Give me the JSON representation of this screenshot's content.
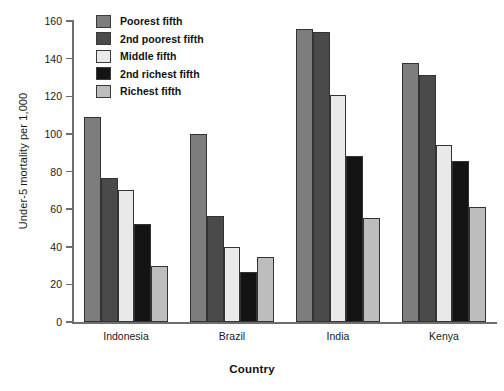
{
  "chart_data": {
    "type": "bar",
    "title": "",
    "xlabel": "Country",
    "ylabel": "Under-5 mortality per 1,000",
    "categories": [
      "Indonesia",
      "Brazil",
      "India",
      "Kenya"
    ],
    "ylim": [
      0,
      160
    ],
    "yticks": [
      0,
      20,
      40,
      60,
      80,
      100,
      120,
      140,
      160
    ],
    "ytick_labels": [
      "0",
      "20",
      "40",
      "60",
      "80",
      "100",
      "120",
      "140",
      "160"
    ],
    "grid": false,
    "legend_position": "top-left-inside",
    "series": [
      {
        "name": "Poorest fifth",
        "color": "#7d7d7d",
        "values": [
          109,
          100,
          156,
          137.5
        ]
      },
      {
        "name": "2nd poorest fifth",
        "color": "#4a4a4a",
        "values": [
          76.5,
          56.5,
          154,
          131.5
        ]
      },
      {
        "name": "Middle fifth",
        "color": "#e9e9e9",
        "values": [
          70,
          40,
          120.5,
          94
        ]
      },
      {
        "name": "2nd richest fifth",
        "color": "#141414",
        "values": [
          52,
          26.5,
          88.5,
          85.5
        ]
      },
      {
        "name": "Richest fifth",
        "color": "#bdbdbd",
        "values": [
          30,
          34.5,
          55.5,
          61
        ]
      }
    ]
  }
}
